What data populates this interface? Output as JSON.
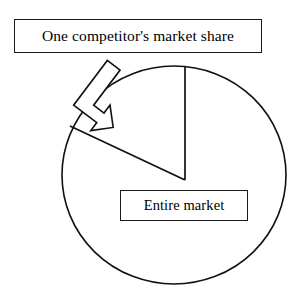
{
  "figure": {
    "title_text": "One competitor's market share",
    "subject_text": "Entire market",
    "kind": "pie-slice-callout-diagram"
  },
  "labels": {
    "competitor_box": {
      "text": "One competitor's market share",
      "x": 14,
      "y": 19,
      "width": 248,
      "height": 34
    },
    "entire_market_box": {
      "text": "Entire market",
      "x": 120,
      "y": 190,
      "width": 128,
      "height": 31
    }
  },
  "shapes": {
    "circle": {
      "name": "entire-market-circle",
      "cx": 174,
      "cy": 175,
      "r": 110,
      "stroke": "#111111",
      "stroke_width": 1.6,
      "fill": "#ffffff"
    },
    "wedge": {
      "name": "competitor-share-wedge",
      "apex_x": 185,
      "apex_y": 180,
      "arm_top_x": 185,
      "arm_top_y": 67,
      "arm_left_x": 70,
      "arm_left_y": 126,
      "stroke": "#111111",
      "stroke_width": 1.6,
      "fill": "none"
    },
    "callout_arrow": {
      "name": "bent-block-arrow",
      "points": "88,67 100,67 100,98 112,98 112,90 131,110 112,131 112,122 88,122",
      "stroke": "#111111",
      "stroke_width": 1.6,
      "fill": "#ffffff",
      "rotation_deg": 215,
      "pivot_x": 95,
      "pivot_y": 95
    }
  },
  "colors": {
    "ink": "#111111",
    "paper": "#ffffff",
    "text": "#000000"
  }
}
